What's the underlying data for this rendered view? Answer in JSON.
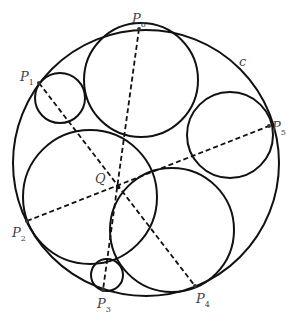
{
  "diagram": {
    "outer_circle_label": "c",
    "center_label": "Q",
    "points": [
      {
        "name": "P",
        "sub": "1",
        "x": 39,
        "y": 83,
        "lx": 20,
        "ly": 70
      },
      {
        "name": "P",
        "sub": "2",
        "x": 27,
        "y": 221,
        "lx": 12,
        "ly": 226
      },
      {
        "name": "P",
        "sub": "3",
        "x": 103,
        "y": 290,
        "lx": 97,
        "ly": 297
      },
      {
        "name": "P",
        "sub": "4",
        "x": 195,
        "y": 286,
        "lx": 196,
        "ly": 292
      },
      {
        "name": "P",
        "sub": "5",
        "x": 269,
        "y": 126,
        "lx": 272,
        "ly": 120
      },
      {
        "name": "P",
        "sub": "6",
        "x": 139,
        "y": 29,
        "lx": 132,
        "ly": 12
      }
    ],
    "circles": [
      {
        "id": "outer",
        "cx": 146,
        "cy": 163,
        "r": 133
      },
      {
        "id": "c1",
        "cx": 60,
        "cy": 98,
        "r": 25
      },
      {
        "id": "c2",
        "cx": 141,
        "cy": 80,
        "r": 57
      },
      {
        "id": "c5",
        "cx": 230,
        "cy": 135,
        "r": 43
      },
      {
        "id": "c2big",
        "cx": 90,
        "cy": 197,
        "r": 67
      },
      {
        "id": "c4",
        "cx": 172,
        "cy": 230,
        "r": 62
      },
      {
        "id": "c3",
        "cx": 107,
        "cy": 275,
        "r": 16
      }
    ],
    "dashed_lines": [
      {
        "from": "P1",
        "to": "P4"
      },
      {
        "from": "P6",
        "to": "P3"
      },
      {
        "from": "P2",
        "to": "P5"
      }
    ]
  }
}
